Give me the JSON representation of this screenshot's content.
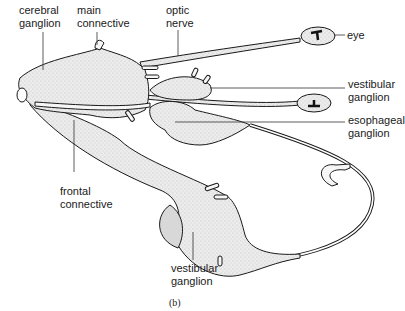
{
  "figure": {
    "caption": "(b)",
    "labels": {
      "cerebral_ganglion": [
        "cerebral",
        "ganglion"
      ],
      "main_connective": [
        "main",
        "connective"
      ],
      "optic_nerve": [
        "optic",
        "nerve"
      ],
      "eye": [
        "eye"
      ],
      "vestibular_ganglion_right": [
        "vestibular",
        "ganglion"
      ],
      "esophageal_ganglion": [
        "esophageal",
        "ganglion"
      ],
      "frontal_connective": [
        "frontal",
        "connective"
      ],
      "vestibular_ganglion_bottom": [
        "vestibular",
        "ganglion"
      ]
    }
  },
  "colors": {
    "ink": "#1a1a1a",
    "fill": "#e6e6e6",
    "background": "#ffffff"
  }
}
